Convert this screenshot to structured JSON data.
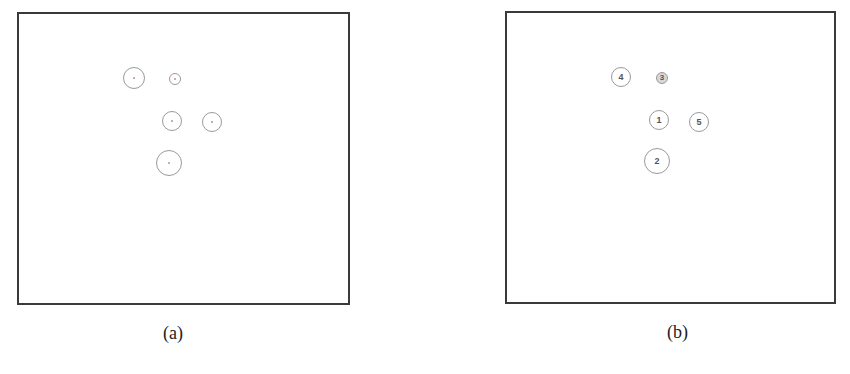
{
  "figure": {
    "panels": [
      {
        "id": "a",
        "caption": "(a)",
        "circles": [
          {
            "label": "",
            "cx": 134,
            "cy": 78,
            "r": 11
          },
          {
            "label": "",
            "cx": 175,
            "cy": 79,
            "r": 6
          },
          {
            "label": "",
            "cx": 172,
            "cy": 121,
            "r": 10
          },
          {
            "label": "",
            "cx": 212,
            "cy": 122,
            "r": 10
          },
          {
            "label": "",
            "cx": 169,
            "cy": 163,
            "r": 13
          }
        ]
      },
      {
        "id": "b",
        "caption": "(b)",
        "circles": [
          {
            "label": "4",
            "cx": 621,
            "cy": 77,
            "r": 10
          },
          {
            "label": "3",
            "cx": 662,
            "cy": 78,
            "r": 6
          },
          {
            "label": "1",
            "cx": 659,
            "cy": 120,
            "r": 10
          },
          {
            "label": "5",
            "cx": 699,
            "cy": 122,
            "r": 10
          },
          {
            "label": "2",
            "cx": 657,
            "cy": 161,
            "r": 13
          }
        ]
      }
    ]
  }
}
